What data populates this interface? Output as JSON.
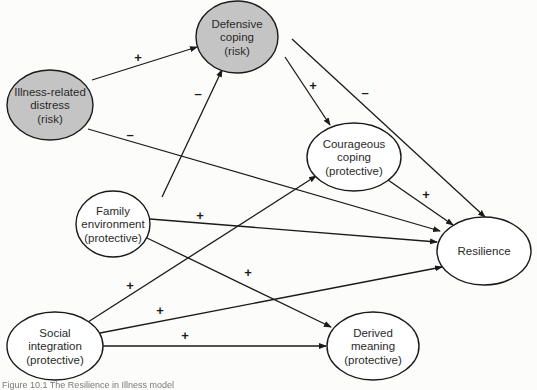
{
  "diagram": {
    "colors": {
      "risk_fill": "#c4c4c4",
      "protective_fill": "#ffffff",
      "stroke": "#1a1a1a",
      "background": "#fcfcfb"
    },
    "nodes": [
      {
        "id": "defensive",
        "lines": [
          "Defensive",
          "coping",
          "(risk)"
        ],
        "type": "risk",
        "cx": 237,
        "cy": 37,
        "rx": 41,
        "ry": 36
      },
      {
        "id": "distress",
        "lines": [
          "Illness-related",
          "distress",
          "(risk)"
        ],
        "type": "risk",
        "cx": 50,
        "cy": 105,
        "rx": 43,
        "ry": 35
      },
      {
        "id": "courageous",
        "lines": [
          "Courageous",
          "coping",
          "(protective)"
        ],
        "type": "protective",
        "cx": 354,
        "cy": 157,
        "rx": 47,
        "ry": 34
      },
      {
        "id": "family",
        "lines": [
          "Family",
          "environment",
          "(protective)"
        ],
        "type": "protective",
        "cx": 113,
        "cy": 224,
        "rx": 37,
        "ry": 33
      },
      {
        "id": "resilience",
        "lines": [
          "Resilience"
        ],
        "type": "protective",
        "cx": 484,
        "cy": 251,
        "rx": 47,
        "ry": 34
      },
      {
        "id": "social",
        "lines": [
          "Social",
          "integration",
          "(protective)"
        ],
        "type": "protective",
        "cx": 55,
        "cy": 346,
        "rx": 48,
        "ry": 34
      },
      {
        "id": "meaning",
        "lines": [
          "Derived",
          "meaning",
          "(protective)"
        ],
        "type": "protective",
        "cx": 373,
        "cy": 346,
        "rx": 46,
        "ry": 34
      }
    ],
    "edges": [
      {
        "from": "distress",
        "to": "defensive",
        "sign": "+",
        "x1": 92,
        "y1": 80,
        "x2": 197,
        "y2": 47,
        "lx": 138,
        "ly": 62
      },
      {
        "from": "family",
        "to": "defensive",
        "sign": "–",
        "x1": 162,
        "y1": 197,
        "x2": 222,
        "y2": 70,
        "lx": 198,
        "ly": 98
      },
      {
        "from": "distress",
        "to": "resilience",
        "sign": "–",
        "x1": 88,
        "y1": 129,
        "x2": 440,
        "y2": 231,
        "lx": 130,
        "ly": 139
      },
      {
        "from": "defensive",
        "to": "courageous",
        "sign": "+",
        "x1": 285,
        "y1": 57,
        "x2": 330,
        "y2": 125,
        "lx": 313,
        "ly": 90
      },
      {
        "from": "defensive",
        "to": "resilience",
        "sign": "–",
        "x1": 292,
        "y1": 39,
        "x2": 485,
        "y2": 217,
        "lx": 365,
        "ly": 97
      },
      {
        "from": "courageous",
        "to": "resilience",
        "sign": "+",
        "x1": 388,
        "y1": 180,
        "x2": 453,
        "y2": 225,
        "lx": 426,
        "ly": 199
      },
      {
        "from": "family",
        "to": "resilience",
        "sign": "+",
        "x1": 150,
        "y1": 219,
        "x2": 437,
        "y2": 242,
        "lx": 200,
        "ly": 220
      },
      {
        "from": "family",
        "to": "meaning",
        "sign": "+",
        "x1": 147,
        "y1": 238,
        "x2": 331,
        "y2": 327,
        "lx": 248,
        "ly": 277
      },
      {
        "from": "social",
        "to": "courageous",
        "sign": "+",
        "x1": 88,
        "y1": 322,
        "x2": 316,
        "y2": 176,
        "lx": 130,
        "ly": 290
      },
      {
        "from": "social",
        "to": "resilience",
        "sign": "+",
        "x1": 100,
        "y1": 333,
        "x2": 442,
        "y2": 267,
        "lx": 160,
        "ly": 315
      },
      {
        "from": "social",
        "to": "meaning",
        "sign": "+",
        "x1": 103,
        "y1": 346,
        "x2": 326,
        "y2": 346,
        "lx": 185,
        "ly": 340
      }
    ]
  },
  "caption": "Figure 10.1   The Resilience in Illness model"
}
